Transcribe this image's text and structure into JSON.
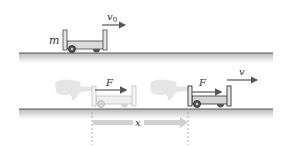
{
  "diagram": {
    "top_scene": {
      "mass_label": "m",
      "velocity_label": "v",
      "velocity_subscript": "0"
    },
    "bottom_scene": {
      "force_label_initial": "F",
      "force_label_final": "F",
      "velocity_label": "v",
      "displacement_label": "x"
    },
    "colors": {
      "floor_line": "#555555",
      "floor_shade": "#c8c8c8",
      "cart_body": "#d9d9d9",
      "cart_outline": "#333333",
      "arrow": "#555555",
      "faded": "#bdbdbd",
      "displacement_arrow": "#cfcfcf"
    }
  }
}
